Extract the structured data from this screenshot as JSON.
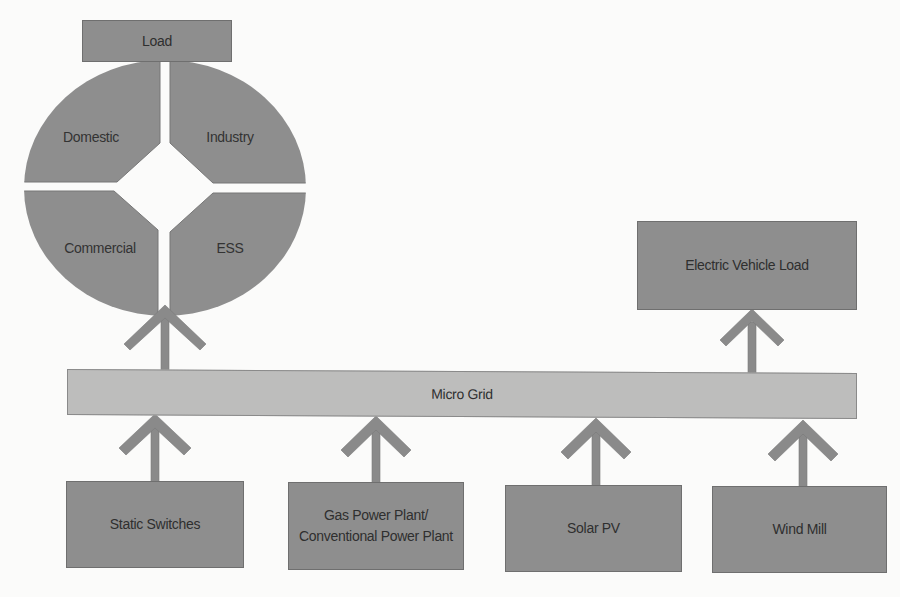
{
  "diagram": {
    "load": {
      "label": "Load",
      "segments": {
        "top_left": "Domestic",
        "top_right": "Industry",
        "bottom_left": "Commercial",
        "bottom_right": "ESS"
      }
    },
    "micro_grid": {
      "label": "Micro Grid"
    },
    "ev_load": {
      "label": "Electric Vehicle Load"
    },
    "sources": [
      {
        "label": "Static Switches"
      },
      {
        "label": "Gas Power Plant/ Conventional Power Plant"
      },
      {
        "label": "Solar PV"
      },
      {
        "label": "Wind Mill"
      }
    ],
    "flows": [
      {
        "from": "Static Switches",
        "to": "Micro Grid"
      },
      {
        "from": "Gas Power Plant/ Conventional Power Plant",
        "to": "Micro Grid"
      },
      {
        "from": "Solar PV",
        "to": "Micro Grid"
      },
      {
        "from": "Wind Mill",
        "to": "Micro Grid"
      },
      {
        "from": "Micro Grid",
        "to": "Load"
      },
      {
        "from": "Micro Grid",
        "to": "Electric Vehicle Load"
      }
    ],
    "colors": {
      "box_dark": "#8e8e8e",
      "box_light": "#bdbdbc",
      "arrow": "#8a8a8a",
      "text": "#2f2f2f",
      "background": "#fbfbfa"
    }
  }
}
